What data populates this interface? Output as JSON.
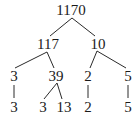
{
  "diagram": {
    "type": "factor-tree",
    "nodes": [
      {
        "id": "n1170",
        "label": "1170",
        "x": 71,
        "y": 3
      },
      {
        "id": "n117",
        "label": "117",
        "x": 48,
        "y": 37
      },
      {
        "id": "n10",
        "label": "10",
        "x": 98,
        "y": 37
      },
      {
        "id": "n3a",
        "label": "3",
        "x": 14,
        "y": 69
      },
      {
        "id": "n39",
        "label": "39",
        "x": 56,
        "y": 69
      },
      {
        "id": "n2a",
        "label": "2",
        "x": 88,
        "y": 69
      },
      {
        "id": "n5a",
        "label": "5",
        "x": 128,
        "y": 69
      },
      {
        "id": "n3b",
        "label": "3",
        "x": 14,
        "y": 100
      },
      {
        "id": "n3c",
        "label": "3",
        "x": 43,
        "y": 100
      },
      {
        "id": "n13",
        "label": "13",
        "x": 64,
        "y": 100
      },
      {
        "id": "n2b",
        "label": "2",
        "x": 88,
        "y": 100
      },
      {
        "id": "n5b",
        "label": "5",
        "x": 128,
        "y": 100
      }
    ],
    "edges": [
      {
        "from": "n1170",
        "to": "n117",
        "x1": 72,
        "y1": 18,
        "x2": 50,
        "y2": 36
      },
      {
        "from": "n1170",
        "to": "n10",
        "x1": 72,
        "y1": 18,
        "x2": 95,
        "y2": 36
      },
      {
        "from": "n117",
        "to": "n3a",
        "x1": 47,
        "y1": 52,
        "x2": 15,
        "y2": 68
      },
      {
        "from": "n117",
        "to": "n39",
        "x1": 47,
        "y1": 52,
        "x2": 54,
        "y2": 68
      },
      {
        "from": "n10",
        "to": "n2a",
        "x1": 97,
        "y1": 51,
        "x2": 90,
        "y2": 68
      },
      {
        "from": "n10",
        "to": "n5a",
        "x1": 97,
        "y1": 51,
        "x2": 126,
        "y2": 68
      },
      {
        "from": "n3a",
        "to": "n3b",
        "x1": 14,
        "y1": 85,
        "x2": 14,
        "y2": 98
      },
      {
        "from": "n39",
        "to": "n3c",
        "x1": 57,
        "y1": 83,
        "x2": 44,
        "y2": 99
      },
      {
        "from": "n39",
        "to": "n13",
        "x1": 57,
        "y1": 83,
        "x2": 62,
        "y2": 99
      },
      {
        "from": "n2a",
        "to": "n2b",
        "x1": 88,
        "y1": 85,
        "x2": 88,
        "y2": 98
      },
      {
        "from": "n5a",
        "to": "n5b",
        "x1": 128,
        "y1": 85,
        "x2": 128,
        "y2": 98
      }
    ]
  }
}
